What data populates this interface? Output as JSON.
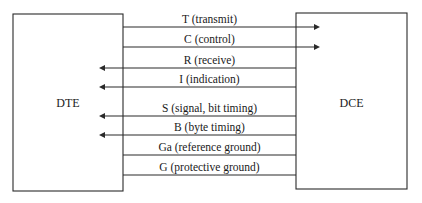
{
  "diagram": {
    "type": "interface-signal-diagram",
    "colors": {
      "stroke": "#2a2a2a",
      "background": "#ffffff",
      "text": "#1a1a1a"
    },
    "left_box": {
      "label": "DTE",
      "x": 13,
      "y": 14,
      "width": 110,
      "height": 177,
      "label_y": 107
    },
    "right_box": {
      "label": "DCE",
      "x": 296,
      "y": 13,
      "width": 111,
      "height": 176,
      "label_y": 107
    },
    "signals": [
      {
        "code": "T",
        "label": "T (transmit)",
        "y": 27,
        "direction": "to-right"
      },
      {
        "code": "C",
        "label": "C (control)",
        "y": 47,
        "direction": "to-right"
      },
      {
        "code": "R",
        "label": "R (receive)",
        "y": 68,
        "direction": "to-left"
      },
      {
        "code": "I",
        "label": "I (indication)",
        "y": 87,
        "direction": "to-left"
      },
      {
        "code": "S",
        "label": "S (signal, bit timing)",
        "y": 116,
        "direction": "to-left"
      },
      {
        "code": "B",
        "label": "B (byte timing)",
        "y": 135,
        "direction": "to-left"
      },
      {
        "code": "Ga",
        "label": "Ga (reference ground)",
        "y": 155,
        "direction": "none"
      },
      {
        "code": "G",
        "label": "G (protective ground)",
        "y": 175,
        "direction": "none"
      }
    ],
    "arrow_tip_left_x": 99,
    "arrow_tip_right_x": 320
  }
}
